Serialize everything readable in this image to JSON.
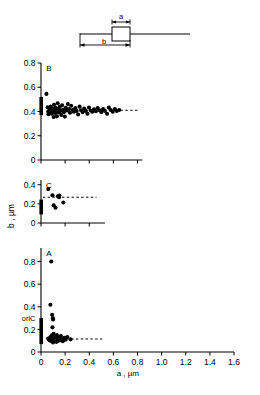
{
  "figure": {
    "schematic": {
      "label_a": "a",
      "label_b": "b",
      "description": "cell-schematic-with-box"
    },
    "axes": {
      "x_label": "a , µm",
      "y_label": "b , µm",
      "x_ticks": [
        "0",
        "0.2",
        "0.4",
        "0.6",
        "0.8",
        "1.0",
        "1.2",
        "1.4",
        "1.6"
      ],
      "x_tick_values": [
        0,
        0.2,
        0.4,
        0.6,
        0.8,
        1.0,
        1.2,
        1.4,
        1.6
      ],
      "x_min": 0,
      "x_max": 1.6
    },
    "panels": [
      {
        "id": "B",
        "label": "B",
        "y_ticks": [
          "0",
          "0.2",
          "0.4",
          "0.6",
          "0.8"
        ],
        "y_tick_values": [
          0,
          0.2,
          0.4,
          0.6,
          0.8
        ],
        "y_min": 0,
        "y_max": 0.8,
        "x_axis_end": 0.84,
        "dashed_level": 0.41,
        "dashed_from": 0.62,
        "dashed_to": 0.8,
        "bar_low": 0.37,
        "bar_high": 0.52
      },
      {
        "id": "C",
        "label": "C",
        "y_ticks": [
          "0",
          "0.2",
          "0.4"
        ],
        "y_tick_values": [
          0,
          0.2,
          0.4
        ],
        "y_min": 0,
        "y_max": 0.45,
        "x_axis_end": 0.53,
        "dashed_level": 0.27,
        "dashed_from": 0.015,
        "dashed_to": 0.46,
        "bar_low": 0.09,
        "bar_high": 0.245
      },
      {
        "id": "A",
        "label": "A",
        "y_ticks": [
          "0",
          "0.2",
          "0.4",
          "0.6",
          "0.8"
        ],
        "y_tick_values": [
          0,
          0.2,
          0.4,
          0.6,
          0.8
        ],
        "y_min": 0,
        "y_max": 0.92,
        "x_axis_end": 1.6,
        "dashed_level": 0.115,
        "dashed_from": 0.25,
        "dashed_to": 0.52,
        "bar_low": 0.07,
        "bar_high": 0.3,
        "ori_label": "oriC",
        "ori_value": 0.3
      }
    ]
  },
  "chart_data": [
    {
      "type": "scatter",
      "panel": "B",
      "title": "B",
      "xlabel": "a , µm",
      "ylabel": "b , µm",
      "xlim": [
        0,
        1.6
      ],
      "ylim": [
        0,
        0.8
      ],
      "grid": false,
      "legend": "none",
      "annotation_dashed_y": 0.41,
      "points": [
        [
          0.045,
          0.545
        ],
        [
          0.055,
          0.435
        ],
        [
          0.06,
          0.4
        ],
        [
          0.062,
          0.378
        ],
        [
          0.07,
          0.415
        ],
        [
          0.075,
          0.392
        ],
        [
          0.08,
          0.44
        ],
        [
          0.085,
          0.405
        ],
        [
          0.09,
          0.382
        ],
        [
          0.095,
          0.425
        ],
        [
          0.1,
          0.398
        ],
        [
          0.105,
          0.355
        ],
        [
          0.108,
          0.455
        ],
        [
          0.112,
          0.412
        ],
        [
          0.118,
          0.388
        ],
        [
          0.122,
          0.43
        ],
        [
          0.128,
          0.402
        ],
        [
          0.132,
          0.36
        ],
        [
          0.138,
          0.468
        ],
        [
          0.142,
          0.418
        ],
        [
          0.148,
          0.392
        ],
        [
          0.155,
          0.438
        ],
        [
          0.16,
          0.405
        ],
        [
          0.168,
          0.372
        ],
        [
          0.175,
          0.452
        ],
        [
          0.182,
          0.415
        ],
        [
          0.19,
          0.395
        ],
        [
          0.198,
          0.358
        ],
        [
          0.205,
          0.43
        ],
        [
          0.215,
          0.408
        ],
        [
          0.222,
          0.462
        ],
        [
          0.232,
          0.42
        ],
        [
          0.24,
          0.39
        ],
        [
          0.25,
          0.448
        ],
        [
          0.262,
          0.412
        ],
        [
          0.272,
          0.398
        ],
        [
          0.285,
          0.428
        ],
        [
          0.295,
          0.405
        ],
        [
          0.308,
          0.375
        ],
        [
          0.32,
          0.44
        ],
        [
          0.332,
          0.41
        ],
        [
          0.345,
          0.395
        ],
        [
          0.358,
          0.425
        ],
        [
          0.372,
          0.405
        ],
        [
          0.385,
          0.382
        ],
        [
          0.398,
          0.432
        ],
        [
          0.412,
          0.408
        ],
        [
          0.425,
          0.398
        ],
        [
          0.44,
          0.418
        ],
        [
          0.455,
          0.402
        ],
        [
          0.47,
          0.428
        ],
        [
          0.485,
          0.41
        ],
        [
          0.5,
          0.395
        ],
        [
          0.515,
          0.42
        ],
        [
          0.53,
          0.405
        ],
        [
          0.548,
          0.382
        ],
        [
          0.562,
          0.432
        ],
        [
          0.578,
          0.412
        ],
        [
          0.595,
          0.398
        ],
        [
          0.612,
          0.42
        ],
        [
          0.628,
          0.405
        ],
        [
          0.648,
          0.412
        ]
      ]
    },
    {
      "type": "scatter",
      "panel": "C",
      "title": "C",
      "xlabel": "a , µm",
      "ylabel": "b , µm",
      "xlim": [
        0,
        1.6
      ],
      "ylim": [
        0,
        0.45
      ],
      "grid": false,
      "legend": "none",
      "annotation_dashed_y": 0.27,
      "points": [
        [
          0.06,
          0.355
        ],
        [
          0.095,
          0.29
        ],
        [
          0.105,
          0.185
        ],
        [
          0.12,
          0.16
        ],
        [
          0.14,
          0.28
        ],
        [
          0.15,
          0.27
        ],
        [
          0.152,
          0.288
        ],
        [
          0.185,
          0.215
        ]
      ]
    },
    {
      "type": "scatter",
      "panel": "A",
      "title": "A",
      "xlabel": "a , µm",
      "ylabel": "b , µm",
      "xlim": [
        0,
        1.6
      ],
      "ylim": [
        0,
        0.92
      ],
      "grid": false,
      "legend": "none",
      "annotation_dashed_y": 0.115,
      "points": [
        [
          0.085,
          0.8
        ],
        [
          0.078,
          0.418
        ],
        [
          0.092,
          0.33
        ],
        [
          0.098,
          0.3
        ],
        [
          0.1,
          0.288
        ],
        [
          0.095,
          0.218
        ],
        [
          0.06,
          0.12
        ],
        [
          0.07,
          0.105
        ],
        [
          0.078,
          0.132
        ],
        [
          0.085,
          0.095
        ],
        [
          0.09,
          0.148
        ],
        [
          0.095,
          0.112
        ],
        [
          0.1,
          0.085
        ],
        [
          0.105,
          0.16
        ],
        [
          0.108,
          0.122
        ],
        [
          0.112,
          0.098
        ],
        [
          0.118,
          0.138
        ],
        [
          0.122,
          0.108
        ],
        [
          0.128,
          0.09
        ],
        [
          0.132,
          0.15
        ],
        [
          0.138,
          0.118
        ],
        [
          0.142,
          0.1
        ],
        [
          0.15,
          0.128
        ],
        [
          0.158,
          0.105
        ],
        [
          0.165,
          0.142
        ],
        [
          0.172,
          0.112
        ],
        [
          0.18,
          0.095
        ],
        [
          0.192,
          0.125
        ],
        [
          0.205,
          0.108
        ],
        [
          0.218,
          0.132
        ],
        [
          0.245,
          0.112
        ]
      ]
    }
  ]
}
